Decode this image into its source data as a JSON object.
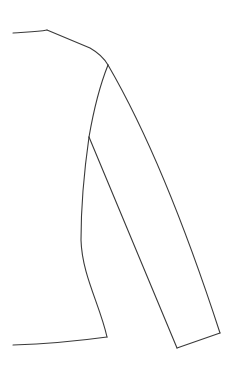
{
  "drawing": {
    "subject": "garment flat sketch — half front of long-sleeve top",
    "stroke_color": "#3a3a3a",
    "background_color": "#ffffff",
    "stroke_width": 1.1,
    "paths": {
      "neckline": "M13,33 C24,32 36,32 47,30",
      "shoulder": "M47,30 L90,48 C97,52 104,58 108,65",
      "armhole": "M108,65 C100,85 94,108 89,137",
      "side_seam": "M89,137 C85,165 81,200 81,240 C82,275 100,305 107,337",
      "hem": "M107,337 C78,341 45,344 13,345",
      "sleeve_outer": "M108,65 C140,120 180,210 220,333",
      "sleeve_inner": "M89,137 L177,348",
      "cuff": "M177,348 L220,333"
    }
  }
}
